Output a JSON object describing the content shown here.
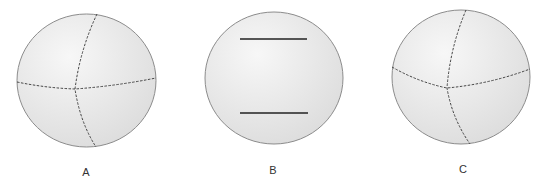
{
  "figure": {
    "colors": {
      "sphere_fill_light": "#f7f7f7",
      "sphere_fill_dark": "#dcdcdc",
      "sphere_outline": "#8c8c8c",
      "dashed_line": "#444444",
      "solid_line": "#222222",
      "label": "#333333"
    },
    "spheres": [
      {
        "label": "A",
        "description": "sphere with two dashed great-circle arcs (equator and meridian) crossing left of center",
        "cx": 86.5,
        "cy": 80.5,
        "rx": 69.5,
        "ry": 66.5,
        "equator_path": "M17,82 Q46,88 75,89 Q116,86 156,78",
        "meridian_path": "M97,14 Q80,50 75,89 Q80,122 96,147",
        "label_x": 86,
        "label_y": 166
      },
      {
        "label": "B",
        "description": "sphere with two parallel solid horizontal lines",
        "cx": 274,
        "cy": 78,
        "rx": 69,
        "ry": 66,
        "lines": [
          {
            "x1": 240,
            "y1": 39,
            "x2": 307,
            "y2": 39
          },
          {
            "x1": 240,
            "y1": 113,
            "x2": 308,
            "y2": 113
          }
        ],
        "label_x": 273,
        "label_y": 164
      },
      {
        "label": "C",
        "description": "sphere with two dashed great-circle arcs (equator and meridian) crossing left of center",
        "cx": 461,
        "cy": 77,
        "rx": 69,
        "ry": 67,
        "equator_path": "M392,67 Q418,82 447,88 Q490,84 530,69",
        "meridian_path": "M466,10 Q450,48 447,88 Q452,118 470,144",
        "label_x": 463,
        "label_y": 163
      }
    ]
  }
}
